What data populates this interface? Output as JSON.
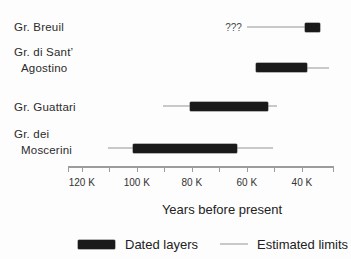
{
  "chart_data": {
    "type": "bar",
    "variant": "horizontal-timeline",
    "title": "",
    "xlabel": "Years before present",
    "x_axis": {
      "unit": "thousand years before present",
      "direction": "older-left-to-younger-right",
      "domain": [
        125,
        28.7
      ],
      "major_ticks": [
        {
          "value": 120,
          "label": "120 K"
        },
        {
          "value": 100,
          "label": "100 K"
        },
        {
          "value": 80,
          "label": "80 K"
        },
        {
          "value": 60,
          "label": "60 K"
        },
        {
          "value": 40,
          "label": "40 K"
        }
      ],
      "minor_ticks": [
        125,
        110,
        90,
        70,
        50,
        28.7
      ]
    },
    "series": [
      {
        "name": "Gr. Breuil",
        "label_lines": [
          "Gr. Breuil"
        ],
        "dated_k": [
          39,
          33.5
        ],
        "estimated_k": [
          60,
          33.5
        ],
        "annotation": "???"
      },
      {
        "name": "Gr. di Sant' Agostino",
        "label_lines": [
          "Gr. di Sant’",
          "Agostino"
        ],
        "dated_k": [
          56.5,
          38
        ],
        "estimated_k": [
          56.5,
          30
        ],
        "annotation": ""
      },
      {
        "name": "Gr. Guattari",
        "label_lines": [
          "Gr. Guattari"
        ],
        "dated_k": [
          80.5,
          52.5
        ],
        "estimated_k": [
          90.5,
          49
        ],
        "annotation": ""
      },
      {
        "name": "Gr. dei Moscerini",
        "label_lines": [
          "Gr. dei",
          "Moscerini"
        ],
        "dated_k": [
          101.5,
          63.5
        ],
        "estimated_k": [
          110.5,
          50.5
        ],
        "annotation": ""
      }
    ],
    "legend": [
      {
        "swatch": "dated-bar",
        "label": "Dated layers"
      },
      {
        "swatch": "estimated-line",
        "label": "Estimated limits"
      }
    ],
    "legend_position": "bottom"
  },
  "colors": {
    "background": "#fdfdfd",
    "dated_bar": "#1a1a1a",
    "estimated_line": "#c9c9c9",
    "axis": "#9c9c9c",
    "text": "#2b2b2b"
  }
}
